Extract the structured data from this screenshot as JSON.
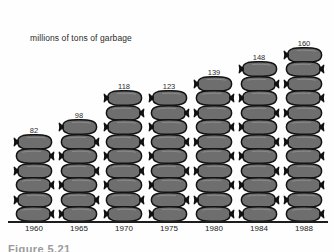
{
  "figure": {
    "axis_label": "millions of tons of garbage",
    "caption": "Figure  5.21",
    "bag_color": "#6e6e6e",
    "bag_outline": "#121212",
    "text_color": "#2b2b2b",
    "axis_color": "#1d1d1d"
  },
  "chart_data": {
    "type": "bar",
    "title": "",
    "subtitle": "",
    "xlabel": "",
    "ylabel": "millions of tons of garbage",
    "categories": [
      "1960",
      "1965",
      "1970",
      "1975",
      "1980",
      "1984",
      "1988"
    ],
    "values": [
      82,
      98,
      118,
      123,
      139,
      148,
      160
    ],
    "value_labels": [
      "82",
      "98",
      "118",
      "123",
      "139",
      "148",
      "160"
    ],
    "icon_counts": [
      6,
      7,
      9,
      9,
      10,
      11,
      12
    ],
    "icon": "garbage-bag-icon",
    "units": "millions of tons",
    "ylim": [
      0,
      170
    ],
    "grid": false,
    "legend": "none",
    "style": "pictograph"
  }
}
